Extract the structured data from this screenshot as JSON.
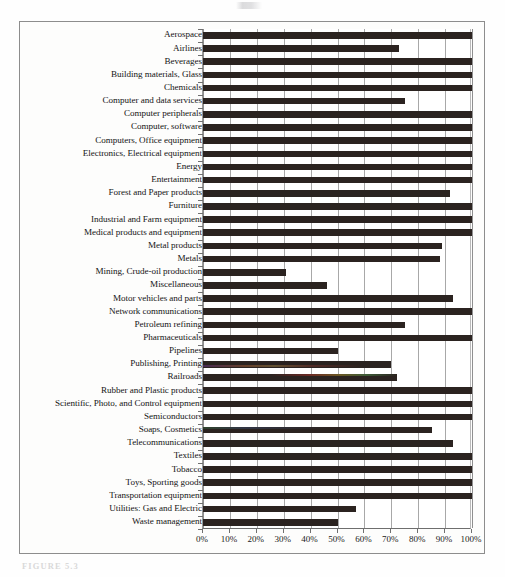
{
  "figure": {
    "caption": "FIGURE 5.3",
    "scan_mark_name": "scan-artifact"
  },
  "chart_data": {
    "type": "bar",
    "orientation": "horizontal",
    "title": "",
    "subtitle": "",
    "xlabel": "",
    "ylabel": "",
    "xlim": [
      0,
      100
    ],
    "ylim": null,
    "grid": true,
    "legend": null,
    "legend_position": "none",
    "value_unit": "%",
    "xticks": [
      0,
      10,
      20,
      30,
      40,
      50,
      60,
      70,
      80,
      90,
      100
    ],
    "xticklabels": [
      "0%",
      "10%",
      "20%",
      "30%",
      "40%",
      "50%",
      "60%",
      "70%",
      "80%",
      "90%",
      "100%"
    ],
    "bar_color": "#2b2320",
    "categories": [
      "Aerospace",
      "Airlines",
      "Beverages",
      "Building materials, Glass",
      "Chemicals",
      "Computer and data services",
      "Computer peripherals",
      "Computer, software",
      "Computers, Office equipment",
      "Electronics, Electrical equipment",
      "Energy",
      "Entertainment",
      "Forest and Paper products",
      "Furniture",
      "Industrial and Farm equipment",
      "Medical products and equipment",
      "Metal products",
      "Metals",
      "Mining, Crude-oil production",
      "Miscellaneous",
      "Motor vehicles and parts",
      "Network communications",
      "Petroleum refining",
      "Pharmaceuticals",
      "Pipelines",
      "Publishing, Printing",
      "Railroads",
      "Rubber and Plastic products",
      "Scientific, Photo, and Control equipment",
      "Semiconductors",
      "Soaps, Cosmetics",
      "Telecommunications",
      "Textiles",
      "Tobacco",
      "Toys, Sporting goods",
      "Transportation equipment",
      "Utilities: Gas and Electric",
      "Waste management"
    ],
    "values": [
      100,
      73,
      100,
      100,
      100,
      75,
      100,
      100,
      100,
      100,
      100,
      100,
      92,
      100,
      100,
      100,
      89,
      88,
      31,
      46,
      93,
      100,
      75,
      100,
      50,
      70,
      72,
      100,
      100,
      100,
      85,
      93,
      100,
      100,
      100,
      100,
      57,
      50
    ]
  }
}
